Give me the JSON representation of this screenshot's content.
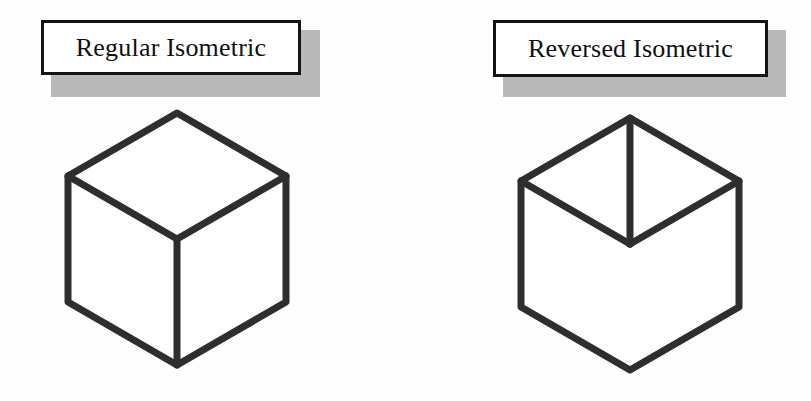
{
  "figure": {
    "background_color": "#fefefe",
    "line_color": "#2e2e2e",
    "shadow_color": "#b9b9b9",
    "box_border_color": "#141414"
  },
  "panels": [
    {
      "id": "regular",
      "caption": "Regular Isometric",
      "cube": {
        "name": "regular-isometric-cube",
        "junction": "downward-y",
        "description": "Hexagonal cube outline viewed from above; interior Y-junction opens upward with a vertical edge descending to the bottom vertex.",
        "outline_points": "137,15 246,78 246,204 137,267 28,204 28,78",
        "top_face_points": "137,15 246,78 137,141 28,78",
        "interior_edges": [
          "28,78 137,141",
          "246,78 137,141",
          "137,141 137,267"
        ],
        "vertices": {
          "top": "137,15",
          "upper_right": "246,78",
          "lower_right": "246,204",
          "bottom": "137,267",
          "lower_left": "28,204",
          "upper_left": "28,78",
          "center": "137,141"
        }
      }
    },
    {
      "id": "reversed",
      "caption": "Reversed Isometric",
      "cube": {
        "name": "reversed-isometric-cube",
        "junction": "upward-y",
        "description": "Hexagonal cube outline viewed from below; interior Y-junction is inverted with a vertical edge rising from the centre to the top vertex.",
        "outline_points": "135,20 244,83 244,209 135,272 26,209 26,83",
        "bottom_face_points": "135,272 244,209 135,146 26,209",
        "interior_edges": [
          "135,20 135,146",
          "26,83 135,146",
          "244,83 135,146"
        ],
        "vertices": {
          "top": "135,20",
          "upper_right": "244,83",
          "lower_right": "244,209",
          "bottom": "135,272",
          "lower_left": "26,209",
          "upper_left": "26,83",
          "center": "135,146"
        }
      }
    }
  ]
}
